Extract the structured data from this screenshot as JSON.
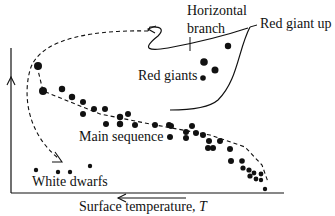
{
  "diagram": {
    "type": "Hertzsprung-Russell diagram sketch",
    "colors": {
      "ink": "#111111",
      "background": "#ffffff"
    },
    "axes": {
      "x_label": "Surface temperature, ",
      "x_label_symbol": "T",
      "x_direction": "temperature increases to the left",
      "y_direction": "luminosity increases upward"
    },
    "labels": {
      "horizontal_branch_line1": "Horizontal",
      "horizontal_branch_line2": "branch",
      "red_giant_up": "Red giant up",
      "red_giants": "Red giants",
      "main_sequence": "Main sequence",
      "white_dwarfs": "White dwarfs"
    },
    "regions": [
      "Horizontal branch",
      "Red giant up",
      "Red giants",
      "Main sequence",
      "White dwarfs"
    ]
  }
}
